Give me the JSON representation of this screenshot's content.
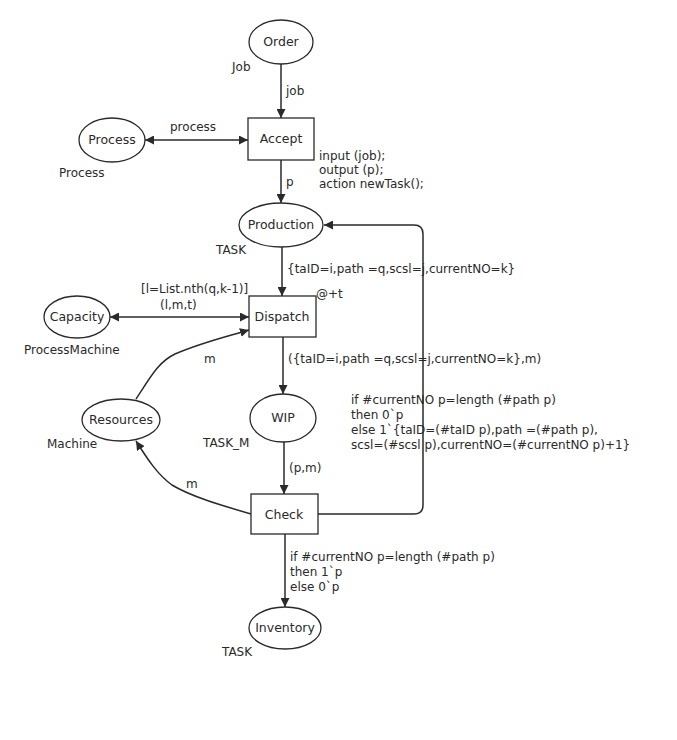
{
  "diagram": {
    "type": "Coloured Petri Net",
    "places": [
      {
        "id": "order",
        "name": "Order",
        "colorset": "Job"
      },
      {
        "id": "process",
        "name": "Process",
        "colorset": "Process"
      },
      {
        "id": "production",
        "name": "Production",
        "colorset": "TASK"
      },
      {
        "id": "capacity",
        "name": "Capacity",
        "colorset": "ProcessMachine"
      },
      {
        "id": "resources",
        "name": "Resources",
        "colorset": "Machine"
      },
      {
        "id": "wip",
        "name": "WIP",
        "colorset": "TASK_M"
      },
      {
        "id": "inventory",
        "name": "Inventory",
        "colorset": "TASK"
      }
    ],
    "transitions": [
      {
        "id": "accept",
        "name": "Accept",
        "code": [
          "input (job);",
          "output (p);",
          "action newTask();"
        ]
      },
      {
        "id": "dispatch",
        "name": "Dispatch",
        "guard": "[l=List.nth(q,k-1)]",
        "delay": "@+t"
      },
      {
        "id": "check",
        "name": "Check"
      }
    ],
    "arcs": {
      "order_accept": "job",
      "process_accept": "process",
      "accept_production": "p",
      "production_dispatch": "{taID=i,path =q,scsl=j,currentNO=k}",
      "capacity_dispatch": "(l,m,t)",
      "resources_dispatch": "m",
      "dispatch_wip": "({taID=i,path =q,scsl=j,currentNO=k},m)",
      "wip_check": "(p,m)",
      "check_resources": "m",
      "check_production": [
        "if #currentNO p=length (#path p)",
        "then 0`p",
        "else 1`{taID=(#taID p),path =(#path p),",
        "scsl=(#scsl p),currentNO=(#currentNO p)+1}"
      ],
      "check_inventory": [
        "if #currentNO p=length (#path p)",
        "then 1`p",
        "else 0`p"
      ]
    }
  },
  "colors": {
    "ink": "#2a2a2a",
    "background": "#ffffff"
  }
}
